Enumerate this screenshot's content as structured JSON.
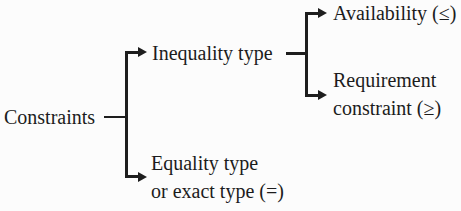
{
  "diagram": {
    "type": "tree",
    "orientation": "left-to-right",
    "root": {
      "label": "Constraints",
      "children": [
        {
          "label": "Inequality type",
          "children": [
            {
              "label": "Availability (≤)"
            },
            {
              "label": "Requirement constraint (≥)"
            }
          ]
        },
        {
          "label": "Equality type or exact type (=)"
        }
      ]
    }
  },
  "labels": {
    "root": "Constraints",
    "inequality": "Inequality type",
    "availability": "Availability (≤)",
    "requirement_line1": "Requirement",
    "requirement_line2": "constraint (≥)",
    "equality_line1": "Equality type",
    "equality_line2": "or exact type (=)"
  },
  "colors": {
    "ink": "#1e1e1e",
    "background": "#fcfcfc"
  }
}
